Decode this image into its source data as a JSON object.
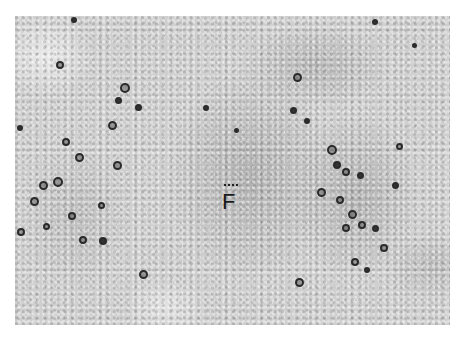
{
  "figure": {
    "type": "micrograph",
    "label": "F",
    "cells": [
      [
        60,
        65,
        8,
        0
      ],
      [
        125,
        88,
        10,
        0
      ],
      [
        118,
        100,
        7,
        1
      ],
      [
        112,
        125,
        9,
        0
      ],
      [
        138,
        107,
        7,
        1
      ],
      [
        66,
        142,
        8,
        0
      ],
      [
        79,
        157,
        9,
        0
      ],
      [
        117,
        165,
        9,
        0
      ],
      [
        20,
        128,
        6,
        1
      ],
      [
        43,
        185,
        9,
        0
      ],
      [
        58,
        182,
        10,
        0
      ],
      [
        34,
        201,
        9,
        0
      ],
      [
        72,
        216,
        8,
        0
      ],
      [
        101,
        205,
        7,
        0
      ],
      [
        21,
        232,
        8,
        0
      ],
      [
        46,
        226,
        7,
        0
      ],
      [
        83,
        240,
        8,
        0
      ],
      [
        103,
        241,
        8,
        1
      ],
      [
        143,
        274,
        9,
        0
      ],
      [
        74,
        20,
        6,
        1
      ],
      [
        297,
        77,
        9,
        0
      ],
      [
        293,
        110,
        7,
        1
      ],
      [
        332,
        150,
        10,
        0
      ],
      [
        337,
        165,
        8,
        1
      ],
      [
        346,
        172,
        8,
        0
      ],
      [
        360,
        175,
        7,
        1
      ],
      [
        321,
        192,
        9,
        0
      ],
      [
        340,
        200,
        8,
        0
      ],
      [
        352,
        214,
        9,
        0
      ],
      [
        346,
        228,
        8,
        0
      ],
      [
        362,
        225,
        8,
        0
      ],
      [
        375,
        228,
        7,
        1
      ],
      [
        384,
        248,
        8,
        0
      ],
      [
        355,
        262,
        8,
        0
      ],
      [
        367,
        270,
        6,
        1
      ],
      [
        399,
        146,
        7,
        0
      ],
      [
        395,
        185,
        7,
        1
      ],
      [
        307,
        121,
        6,
        1
      ],
      [
        299,
        282,
        9,
        0
      ],
      [
        206,
        108,
        6,
        1
      ],
      [
        236,
        130,
        5,
        1
      ],
      [
        375,
        22,
        6,
        1
      ],
      [
        414,
        45,
        5,
        1
      ]
    ]
  }
}
